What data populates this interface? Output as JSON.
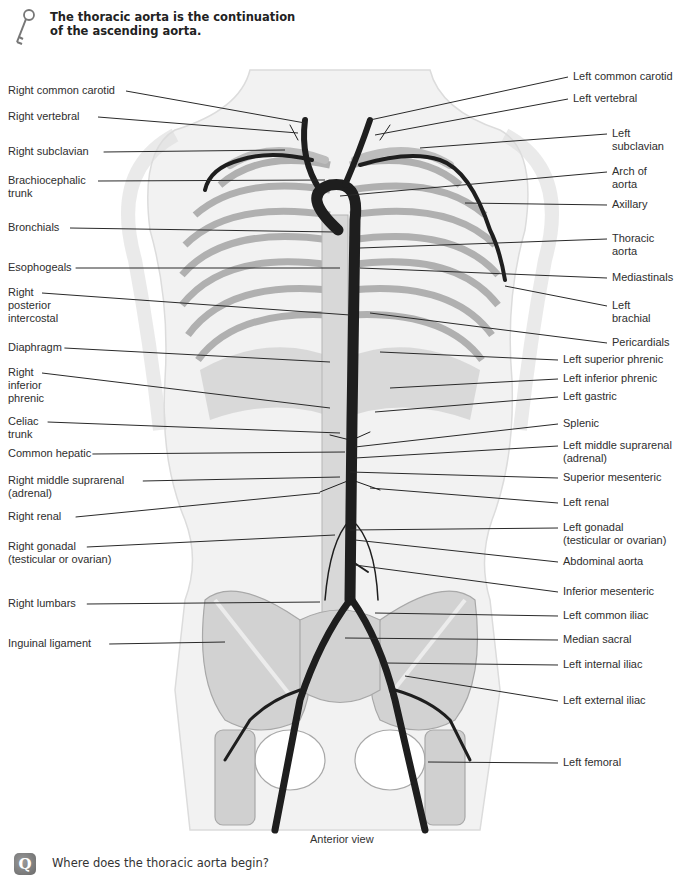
{
  "key_note": {
    "icon": "key-icon",
    "line1": "The thoracic aorta is the continuation",
    "line2": "of the ascending aorta."
  },
  "figure": {
    "caption": "Anterior view",
    "left_labels": [
      {
        "lines": [
          "Right common carotid"
        ],
        "x": 8,
        "y": 84,
        "tx": 305,
        "ty": 123
      },
      {
        "lines": [
          "Right vertebral"
        ],
        "x": 8,
        "y": 110,
        "tx": 298,
        "ty": 133
      },
      {
        "lines": [
          "Right subclavian"
        ],
        "x": 8,
        "y": 145,
        "tx": 285,
        "ty": 150
      },
      {
        "lines": [
          "Brachiocephalic",
          "trunk"
        ],
        "x": 8,
        "y": 174,
        "tx": 325,
        "ty": 180
      },
      {
        "lines": [
          "Bronchials"
        ],
        "x": 8,
        "y": 221,
        "tx": 335,
        "ty": 232
      },
      {
        "lines": [
          "Esophogeals"
        ],
        "x": 8,
        "y": 261,
        "tx": 340,
        "ty": 268
      },
      {
        "lines": [
          "Right",
          "posterior",
          "intercostal"
        ],
        "x": 8,
        "y": 286,
        "tx": 350,
        "ty": 315
      },
      {
        "lines": [
          "Diaphragm"
        ],
        "x": 8,
        "y": 341,
        "tx": 330,
        "ty": 362
      },
      {
        "lines": [
          "Right",
          "inferior",
          "phrenic"
        ],
        "x": 8,
        "y": 366,
        "tx": 330,
        "ty": 408
      },
      {
        "lines": [
          "Celiac",
          "trunk"
        ],
        "x": 8,
        "y": 415,
        "tx": 340,
        "ty": 433
      },
      {
        "lines": [
          "Common hepatic"
        ],
        "x": 8,
        "y": 447,
        "tx": 345,
        "ty": 452
      },
      {
        "lines": [
          "Right middle suprarenal",
          "(adrenal)"
        ],
        "x": 8,
        "y": 474,
        "tx": 340,
        "ty": 477
      },
      {
        "lines": [
          "Right renal"
        ],
        "x": 8,
        "y": 510,
        "tx": 320,
        "ty": 493
      },
      {
        "lines": [
          "Right gonadal",
          "(testicular or ovarian)"
        ],
        "x": 8,
        "y": 540,
        "tx": 335,
        "ty": 535
      },
      {
        "lines": [
          "Right lumbars"
        ],
        "x": 8,
        "y": 597,
        "tx": 320,
        "ty": 602
      },
      {
        "lines": [
          "Inguinal ligament"
        ],
        "x": 8,
        "y": 637,
        "tx": 225,
        "ty": 642
      }
    ],
    "right_labels": [
      {
        "lines": [
          "Left common carotid"
        ],
        "x": 573,
        "y": 70,
        "tx": 370,
        "ty": 120
      },
      {
        "lines": [
          "Left vertebral"
        ],
        "x": 573,
        "y": 92,
        "tx": 375,
        "ty": 135
      },
      {
        "lines": [
          "Left",
          "subclavian"
        ],
        "x": 612,
        "y": 127,
        "tx": 420,
        "ty": 148
      },
      {
        "lines": [
          "Arch of",
          "aorta"
        ],
        "x": 612,
        "y": 165,
        "tx": 340,
        "ty": 196
      },
      {
        "lines": [
          "Axillary"
        ],
        "x": 612,
        "y": 198,
        "tx": 465,
        "ty": 203
      },
      {
        "lines": [
          "Thoracic",
          "aorta"
        ],
        "x": 612,
        "y": 232,
        "tx": 360,
        "ty": 248
      },
      {
        "lines": [
          "Mediastinals"
        ],
        "x": 612,
        "y": 271,
        "tx": 360,
        "ty": 268
      },
      {
        "lines": [
          "Left",
          "brachial"
        ],
        "x": 612,
        "y": 299,
        "tx": 505,
        "ty": 286
      },
      {
        "lines": [
          "Pericardials"
        ],
        "x": 612,
        "y": 336,
        "tx": 370,
        "ty": 313
      },
      {
        "lines": [
          "Left superior phrenic"
        ],
        "x": 563,
        "y": 353,
        "tx": 380,
        "ty": 352
      },
      {
        "lines": [
          "Left inferior phrenic"
        ],
        "x": 563,
        "y": 372,
        "tx": 390,
        "ty": 388
      },
      {
        "lines": [
          "Left gastric"
        ],
        "x": 563,
        "y": 390,
        "tx": 375,
        "ty": 412
      },
      {
        "lines": [
          "Splenic"
        ],
        "x": 563,
        "y": 417,
        "tx": 355,
        "ty": 447
      },
      {
        "lines": [
          "Left middle suprarenal",
          "(adrenal)"
        ],
        "x": 563,
        "y": 439,
        "tx": 355,
        "ty": 458
      },
      {
        "lines": [
          "Superior mesenteric"
        ],
        "x": 563,
        "y": 471,
        "tx": 350,
        "ty": 472
      },
      {
        "lines": [
          "Left renal"
        ],
        "x": 563,
        "y": 496,
        "tx": 370,
        "ty": 488
      },
      {
        "lines": [
          "Left gonadal",
          "(testicular or ovarian)"
        ],
        "x": 563,
        "y": 521,
        "tx": 350,
        "ty": 530
      },
      {
        "lines": [
          "Abdominal aorta"
        ],
        "x": 563,
        "y": 555,
        "tx": 355,
        "ty": 540
      },
      {
        "lines": [
          "Inferior mesenteric"
        ],
        "x": 563,
        "y": 585,
        "tx": 355,
        "ty": 565
      },
      {
        "lines": [
          "Left common iliac"
        ],
        "x": 563,
        "y": 609,
        "tx": 375,
        "ty": 613
      },
      {
        "lines": [
          "Median sacral"
        ],
        "x": 563,
        "y": 633,
        "tx": 345,
        "ty": 638
      },
      {
        "lines": [
          "Left internal iliac"
        ],
        "x": 563,
        "y": 658,
        "tx": 385,
        "ty": 663
      },
      {
        "lines": [
          "Left external iliac"
        ],
        "x": 563,
        "y": 694,
        "tx": 405,
        "ty": 676
      },
      {
        "lines": [
          "Left femoral"
        ],
        "x": 563,
        "y": 756,
        "tx": 428,
        "ty": 762
      }
    ]
  },
  "question": {
    "badge": "Q",
    "text": "Where does the thoracic aorta begin?"
  },
  "colors": {
    "artery": "#1e1e1e",
    "bone": "#cfcfcf",
    "body_outline": "#e4e4e4",
    "leader": "#2a2a2a"
  }
}
